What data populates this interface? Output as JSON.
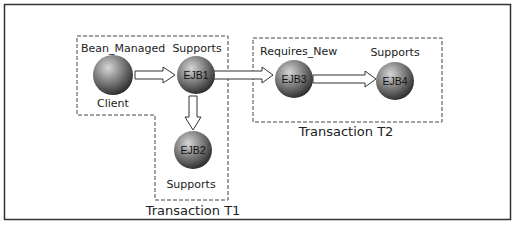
{
  "diagram": {
    "nodes": [
      {
        "id": "client",
        "name": "Client",
        "attribute": "Bean_Managed"
      },
      {
        "id": "ejb1",
        "name": "EJB1",
        "attribute": "Supports"
      },
      {
        "id": "ejb2",
        "name": "EJB2",
        "attribute": "Supports"
      },
      {
        "id": "ejb3",
        "name": "EJB3",
        "attribute": "Requires_New"
      },
      {
        "id": "ejb4",
        "name": "EJB4",
        "attribute": "Supports"
      }
    ],
    "edges": [
      {
        "from": "client",
        "to": "ejb1"
      },
      {
        "from": "ejb1",
        "to": "ejb2"
      },
      {
        "from": "ejb1",
        "to": "ejb3"
      },
      {
        "from": "ejb3",
        "to": "ejb4"
      }
    ],
    "transactions": [
      {
        "id": "t1",
        "label": "Transaction T1",
        "members": [
          "client",
          "ejb1",
          "ejb2"
        ]
      },
      {
        "id": "t2",
        "label": "Transaction T2",
        "members": [
          "ejb3",
          "ejb4"
        ]
      }
    ],
    "colors": {
      "sphere_light": "#c8c8c8",
      "sphere_dark": "#3a3a3a",
      "border": "#333333"
    }
  }
}
